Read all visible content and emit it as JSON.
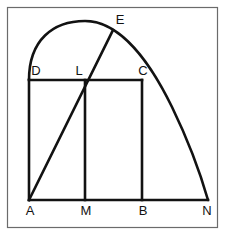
{
  "figure": {
    "canvas": {
      "width": 225,
      "height": 235,
      "background": "#ffffff"
    },
    "colors": {
      "stroke": "#121212",
      "frame": "#6b6b6b",
      "label": "#121212",
      "background": "#ffffff"
    },
    "frame": {
      "name": "outer-border",
      "x": 7.5,
      "y": 7.5,
      "width": 210,
      "height": 220,
      "stroke_width": 1.2
    },
    "stroke_width_main": 2.6,
    "points": [
      {
        "id": "A",
        "label": "A",
        "x": 29,
        "y": 200,
        "label_x": 30,
        "label_y": 215
      },
      {
        "id": "M",
        "label": "M",
        "x": 85,
        "y": 200,
        "label_x": 86,
        "label_y": 215
      },
      {
        "id": "B",
        "label": "B",
        "x": 142,
        "y": 200,
        "label_x": 143,
        "label_y": 215
      },
      {
        "id": "N",
        "label": "N",
        "x": 208,
        "y": 200,
        "label_x": 207,
        "label_y": 215
      },
      {
        "id": "D",
        "label": "D",
        "x": 29,
        "y": 80,
        "label_x": 36,
        "label_y": 75
      },
      {
        "id": "L",
        "label": "L",
        "x": 85,
        "y": 80,
        "label_x": 79,
        "label_y": 75
      },
      {
        "id": "C",
        "label": "C",
        "x": 142,
        "y": 80,
        "label_x": 143,
        "label_y": 75
      },
      {
        "id": "E",
        "label": "E",
        "x": 113,
        "y": 30,
        "label_x": 120,
        "label_y": 24
      }
    ],
    "segments": [
      {
        "id": "AN",
        "name": "baseline-segment-a-n",
        "x1": 29,
        "y1": 200,
        "x2": 208,
        "y2": 200
      },
      {
        "id": "AD",
        "name": "segment-a-d",
        "x1": 29,
        "y1": 200,
        "x2": 29,
        "y2": 80
      },
      {
        "id": "DC",
        "name": "segment-d-c",
        "x1": 29,
        "y1": 80,
        "x2": 142,
        "y2": 80
      },
      {
        "id": "CB",
        "name": "segment-c-b",
        "x1": 142,
        "y1": 80,
        "x2": 142,
        "y2": 200
      },
      {
        "id": "LM",
        "name": "segment-l-m",
        "x1": 85,
        "y1": 80,
        "x2": 85,
        "y2": 200
      },
      {
        "id": "AE",
        "name": "diagonal-segment-a-e",
        "x1": 29,
        "y1": 200,
        "x2": 113,
        "y2": 30
      }
    ],
    "arc": {
      "id": "DEN",
      "name": "curved-arc-d-apex-n",
      "start": {
        "x": 29,
        "y": 80
      },
      "end": {
        "x": 208,
        "y": 200
      },
      "apex": {
        "x": 85,
        "y": 21
      },
      "passes_through_E": {
        "x": 113,
        "y": 30
      },
      "path": "M 29 80 C 29 40 53 21 85 21 C 120 21 150 62 172 107 C 188 140 200 172 208 200"
    },
    "labels_order": [
      "D",
      "L",
      "C",
      "E",
      "A",
      "M",
      "B",
      "N"
    ]
  }
}
